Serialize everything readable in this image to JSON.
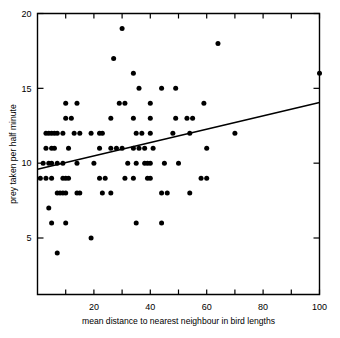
{
  "chart_data": {
    "type": "scatter",
    "title": "",
    "xlabel": "mean distance to nearest neighbour in bird lengths",
    "ylabel": "prey taken per half minute",
    "xlim": [
      0,
      100
    ],
    "ylim": [
      3.1,
      20
    ],
    "grid": false,
    "legend": null,
    "x_ticks_major": [
      20,
      40,
      60,
      80,
      100
    ],
    "x_ticks_minor": [
      10,
      30,
      50,
      70,
      90
    ],
    "x_ticklabels": [
      "20",
      "40",
      "60",
      "80",
      "100"
    ],
    "y_ticks_major": [
      5,
      10,
      15,
      20
    ],
    "y_ticklabels": [
      "5",
      "10",
      "15",
      "20"
    ],
    "marker": "filled-circle",
    "marker_color": "#000000",
    "points": [
      [
        30,
        19
      ],
      [
        64,
        18
      ],
      [
        27,
        17
      ],
      [
        100,
        16
      ],
      [
        34,
        16
      ],
      [
        36,
        15
      ],
      [
        44,
        15
      ],
      [
        49,
        15
      ],
      [
        10,
        14
      ],
      [
        14,
        14
      ],
      [
        29,
        14
      ],
      [
        31,
        14
      ],
      [
        40,
        14
      ],
      [
        59,
        14
      ],
      [
        10,
        13
      ],
      [
        12,
        13
      ],
      [
        26,
        13
      ],
      [
        34,
        13
      ],
      [
        40,
        13
      ],
      [
        49,
        13
      ],
      [
        53,
        13
      ],
      [
        55,
        13
      ],
      [
        3,
        12
      ],
      [
        4,
        12
      ],
      [
        5,
        12
      ],
      [
        6,
        12
      ],
      [
        7,
        12
      ],
      [
        9,
        12
      ],
      [
        13,
        12
      ],
      [
        15,
        12
      ],
      [
        19,
        12
      ],
      [
        22,
        12
      ],
      [
        23,
        12
      ],
      [
        35,
        12
      ],
      [
        37,
        12
      ],
      [
        40,
        12
      ],
      [
        48,
        12
      ],
      [
        54,
        12
      ],
      [
        70,
        12
      ],
      [
        3,
        11
      ],
      [
        5,
        11
      ],
      [
        6,
        11
      ],
      [
        11,
        11
      ],
      [
        22,
        11
      ],
      [
        26,
        11
      ],
      [
        28,
        11
      ],
      [
        30,
        11
      ],
      [
        34,
        11
      ],
      [
        36,
        11
      ],
      [
        38,
        11
      ],
      [
        41,
        11
      ],
      [
        60,
        11
      ],
      [
        2,
        10
      ],
      [
        4,
        10
      ],
      [
        5,
        10
      ],
      [
        7,
        10
      ],
      [
        9,
        10
      ],
      [
        14,
        10
      ],
      [
        20,
        10
      ],
      [
        32,
        10
      ],
      [
        35,
        10
      ],
      [
        38,
        10
      ],
      [
        39,
        10
      ],
      [
        40,
        10
      ],
      [
        45,
        10
      ],
      [
        50,
        10
      ],
      [
        1,
        9
      ],
      [
        3,
        9
      ],
      [
        5,
        9
      ],
      [
        9,
        9
      ],
      [
        10,
        9
      ],
      [
        11,
        9
      ],
      [
        22,
        9
      ],
      [
        24,
        9
      ],
      [
        31,
        9
      ],
      [
        34,
        9
      ],
      [
        39,
        9
      ],
      [
        40,
        9
      ],
      [
        58,
        9
      ],
      [
        60,
        9
      ],
      [
        7,
        8
      ],
      [
        8,
        8
      ],
      [
        9,
        8
      ],
      [
        10,
        8
      ],
      [
        14,
        8
      ],
      [
        15,
        8
      ],
      [
        23,
        8
      ],
      [
        26,
        8
      ],
      [
        44,
        8
      ],
      [
        46,
        8
      ],
      [
        54,
        8
      ],
      [
        4,
        7
      ],
      [
        5,
        6
      ],
      [
        10,
        6
      ],
      [
        35,
        6
      ],
      [
        44,
        6
      ],
      [
        19,
        5
      ],
      [
        7,
        4
      ]
    ],
    "fit_line": {
      "style": "solid",
      "x_start": 0,
      "y_start": 9.6,
      "x_end": 100,
      "y_end": 14.05
    }
  }
}
